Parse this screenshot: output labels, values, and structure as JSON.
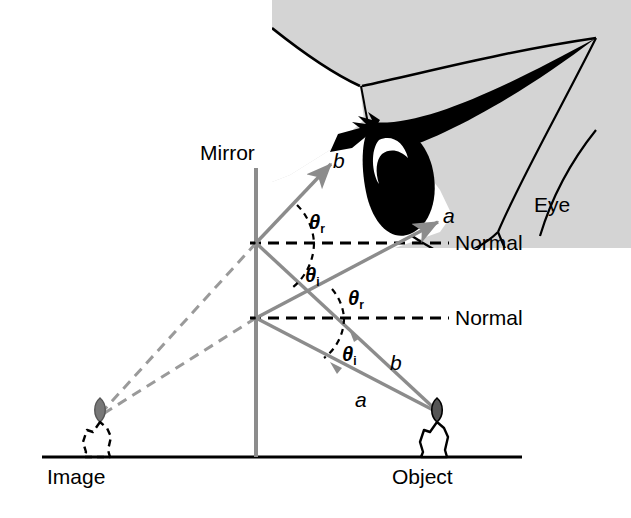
{
  "figure": {
    "type": "optics-ray-diagram",
    "width": 631,
    "height": 518,
    "background_color": "#ffffff"
  },
  "colors": {
    "ray": "#8c8c8c",
    "virtual_ray": "#9a9a9a",
    "mirror": "#8c8c8c",
    "normal": "#000000",
    "ground": "#000000",
    "eye_skin": "#d4d4d4",
    "eye_dark": "#000000",
    "text": "#000000",
    "flame": "#5a5a5a"
  },
  "labels": {
    "mirror": "Mirror",
    "eye": "Eye",
    "normal_upper": "Normal",
    "normal_lower": "Normal",
    "image": "Image",
    "object": "Object",
    "ray_b_upper": "b",
    "ray_a_upper": "a",
    "ray_b_lower": "b",
    "ray_a_lower": "a",
    "theta_r_upper": "θ",
    "theta_r_upper_sub": "r",
    "theta_i_upper": "θ",
    "theta_i_upper_sub": "i",
    "theta_r_lower": "θ",
    "theta_r_lower_sub": "r",
    "theta_i_lower": "θ",
    "theta_i_lower_sub": "i"
  },
  "geometry": {
    "mirror_line": {
      "x": 256,
      "y_top": 168,
      "y_bottom": 457
    },
    "ground_line": {
      "x1": 42,
      "x2": 522,
      "y": 457
    },
    "reflection_point_upper": {
      "x": 256,
      "y": 243
    },
    "reflection_point_lower": {
      "x": 256,
      "y": 318
    },
    "object_flame": {
      "x": 437,
      "y": 412
    },
    "image_flame": {
      "x": 100,
      "y": 412
    },
    "normal_upper": {
      "x1": 256,
      "x2": 447,
      "y": 243
    },
    "normal_lower": {
      "x1": 256,
      "x2": 447,
      "y": 318
    },
    "ray_a_incident": {
      "x1": 437,
      "y1": 412,
      "x2": 256,
      "y2": 318
    },
    "ray_a_reflected": {
      "x1": 256,
      "y1": 318,
      "x2": 437,
      "y2": 222
    },
    "ray_b_incident": {
      "x1": 437,
      "y1": 412,
      "x2": 256,
      "y2": 243
    },
    "ray_b_reflected": {
      "x1": 256,
      "y1": 243,
      "x2": 330,
      "y2": 163
    },
    "virtual_ray_upper": {
      "x1": 256,
      "y1": 243,
      "x2": 100,
      "y2": 412
    },
    "virtual_ray_lower": {
      "x1": 256,
      "y1": 318,
      "x2": 100,
      "y2": 412
    }
  },
  "physics": {
    "law": "angle of incidence equals angle of reflection",
    "angle_incidence_symbol": "θi",
    "angle_reflection_symbol": "θr"
  }
}
